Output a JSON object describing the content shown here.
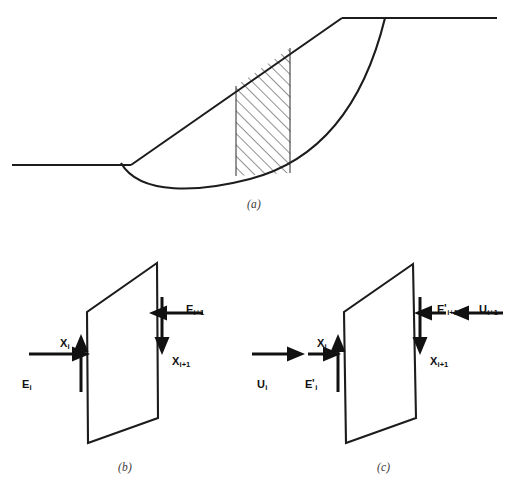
{
  "figure": {
    "background_color": "#ffffff",
    "line_color": "#1c1c1c",
    "panels": [
      {
        "id": "a",
        "caption": "(a)",
        "description": "Slope cross-section with circular slip surface and one hatched vertical slice"
      },
      {
        "id": "b",
        "caption": "(b)",
        "description": "Slice free body with total interslice forces"
      },
      {
        "id": "c",
        "caption": "(c)",
        "description": "Slice free body with effective interslice forces and water forces"
      }
    ]
  },
  "panel_a": {
    "caption": "(a)",
    "elements": {
      "ground_surface_lower": "lower-ground-line",
      "slope_face": "slope-face-line",
      "ground_surface_upper": "upper-ground-line",
      "slip_circle": "circular-slip-surface",
      "slice": "hatched-slice",
      "slice_left_edge": "slice-left-boundary",
      "slice_right_edge": "slice-right-boundary"
    }
  },
  "panel_b": {
    "caption": "(b)",
    "slice_shape": "slice-quadrilateral",
    "forces": [
      {
        "key": "E_i",
        "name": "force-label-Ei",
        "symbol": "E",
        "sub": "i",
        "prime": false,
        "direction": "right",
        "side": "left"
      },
      {
        "key": "X_i",
        "name": "force-label-Xi",
        "symbol": "X",
        "sub": "i",
        "prime": false,
        "direction": "up",
        "side": "left"
      },
      {
        "key": "E_i+1",
        "name": "force-label-Ei1",
        "symbol": "E",
        "sub": "i+1",
        "prime": false,
        "direction": "left",
        "side": "right"
      },
      {
        "key": "X_i+1",
        "name": "force-label-Xi1",
        "symbol": "X",
        "sub": "i+1",
        "prime": false,
        "direction": "down",
        "side": "right"
      }
    ],
    "labels": {
      "Ei": {
        "text": "E",
        "sub": "i"
      },
      "Xi": {
        "text": "X",
        "sub": "i"
      },
      "Ei1": {
        "text": "E",
        "sub": "i+1"
      },
      "Xi1": {
        "text": "X",
        "sub": "i+1"
      }
    }
  },
  "panel_c": {
    "caption": "(c)",
    "slice_shape": "slice-quadrilateral",
    "forces": [
      {
        "key": "U_i",
        "name": "force-label-Ui",
        "symbol": "U",
        "sub": "i",
        "prime": false,
        "direction": "right",
        "side": "left"
      },
      {
        "key": "E'_i",
        "name": "force-label-Epi",
        "symbol": "E",
        "sub": "i",
        "prime": true,
        "direction": "right",
        "side": "left"
      },
      {
        "key": "X_i",
        "name": "force-label-Xi",
        "symbol": "X",
        "sub": "i",
        "prime": false,
        "direction": "up",
        "side": "left"
      },
      {
        "key": "U_i+1",
        "name": "force-label-Ui1",
        "symbol": "U",
        "sub": "i+1",
        "prime": false,
        "direction": "left",
        "side": "right"
      },
      {
        "key": "E'_i+1",
        "name": "force-label-Epi1",
        "symbol": "E",
        "sub": "i+1",
        "prime": true,
        "direction": "left",
        "side": "right"
      },
      {
        "key": "X_i+1",
        "name": "force-label-Xi1",
        "symbol": "X",
        "sub": "i+1",
        "prime": false,
        "direction": "down",
        "side": "right"
      }
    ],
    "labels": {
      "Ui": {
        "text": "U",
        "sub": "i"
      },
      "Epi": {
        "text": "E",
        "prime": "'",
        "sub": "i"
      },
      "Xi": {
        "text": "X",
        "sub": "i"
      },
      "Ui1": {
        "text": "U",
        "sub": "i+1"
      },
      "Epi1": {
        "text": "E",
        "prime": "'",
        "sub": "i+1"
      },
      "Xi1": {
        "text": "X",
        "sub": "i+1"
      }
    }
  },
  "captions": {
    "a": "(a)",
    "b": "(b)",
    "c": "(c)"
  }
}
